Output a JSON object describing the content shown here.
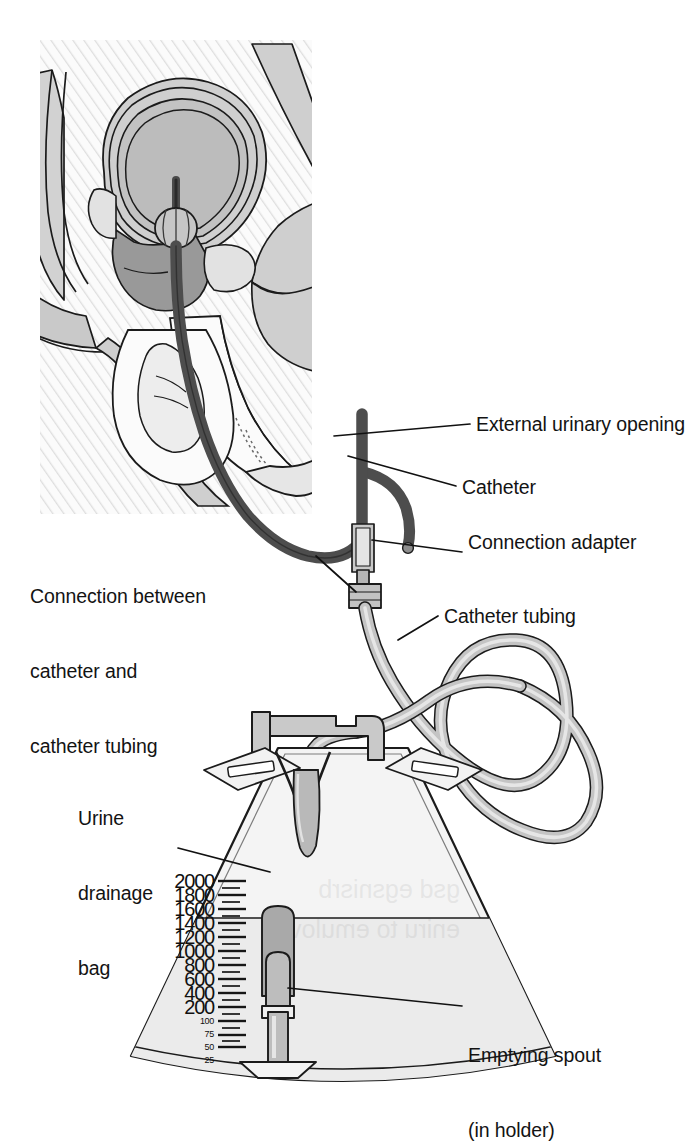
{
  "figure": {
    "background_color": "#ffffff",
    "ink_color": "#111111",
    "tube_fill": "#b8b8b8",
    "catheter_fill": "#6e6e6e",
    "bag_fill": "#f2f2f2",
    "urine_fill": "#ededed",
    "tissue_light": "#efefef",
    "tissue_mid": "#d6d6d6",
    "tissue_dark": "#a8a8a8",
    "hatch_color": "#dcdcdc"
  },
  "labels": {
    "external_urinary_opening": "External urinary opening",
    "catheter": "Catheter",
    "connection_adapter": "Connection adapter",
    "connection_between": [
      "Connection between",
      "catheter and",
      "catheter tubing"
    ],
    "catheter_tubing": "Catheter tubing",
    "urine_drainage_bag": [
      "Urine",
      "drainage",
      "bag"
    ],
    "emptying_spout": [
      "Emptying spout",
      "(in holder)"
    ]
  },
  "drainage_bag": {
    "units": "mL",
    "fill_level": 1400,
    "capacity": 2000,
    "major_marks": [
      2000,
      1800,
      1600,
      1400,
      1200,
      1000,
      800,
      600,
      400,
      200
    ],
    "minor_marks": [
      100,
      75,
      50,
      25
    ]
  }
}
